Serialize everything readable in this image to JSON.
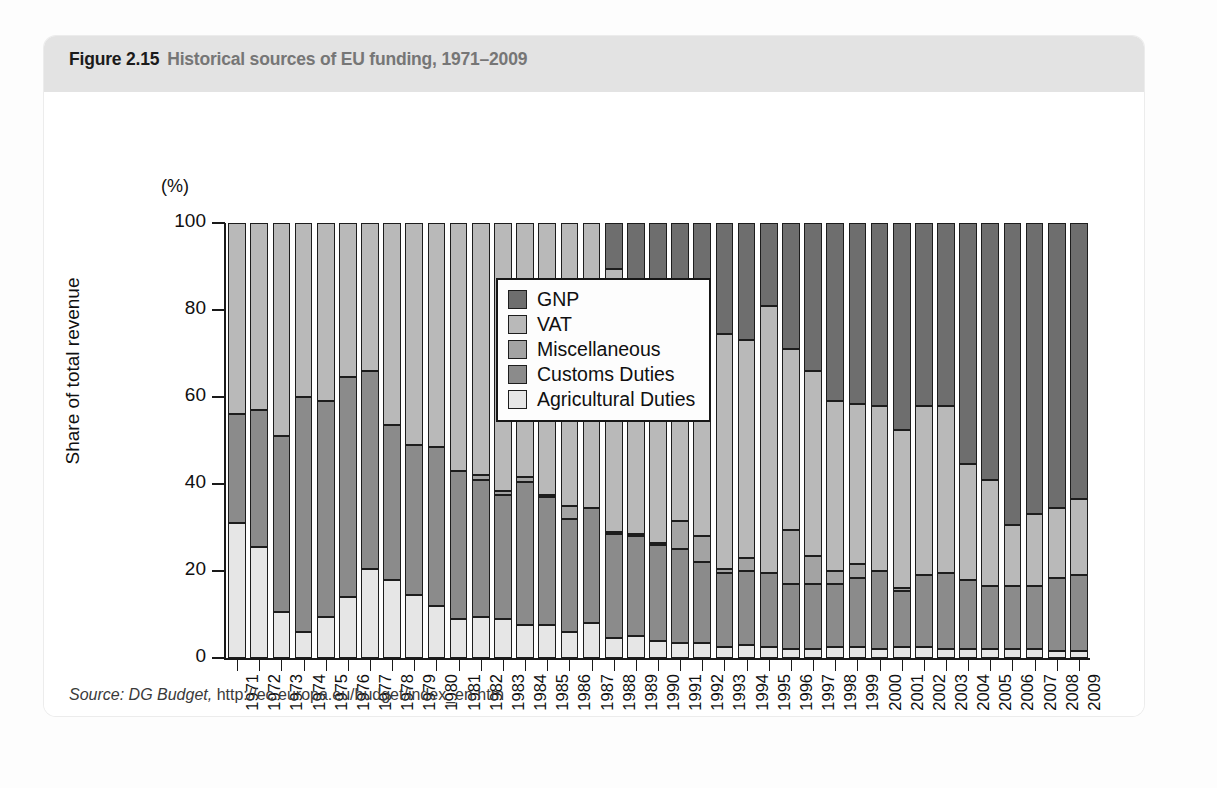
{
  "figure": {
    "label": "Figure 2.15",
    "caption": "Historical sources of EU funding, 1971–2009",
    "source_italic": "Source: DG Budget,",
    "source_rest": "http://ec.europa.eu/budget/index_en.htm"
  },
  "chart_data": {
    "type": "bar",
    "subtype": "stacked-percentage-column",
    "title": "Historical sources of EU funding, 1971–2009",
    "xlabel": "",
    "ylabel": "Share of total revenue",
    "yunit": "(%)",
    "ylim": [
      0,
      100
    ],
    "yticks": [
      0,
      20,
      40,
      60,
      80,
      100
    ],
    "grid": false,
    "legend_position": "center-left-inside",
    "stack_order_bottom_to_top": [
      "Agricultural Duties",
      "Customs Duties",
      "Miscellaneous",
      "VAT",
      "GNP"
    ],
    "colors": {
      "GNP": "#6e6e6e",
      "VAT": "#b9b9b9",
      "Miscellaneous": "#a3a3a3",
      "Customs Duties": "#8b8b8b",
      "Agricultural Duties": "#e6e6e6"
    },
    "categories": [
      "1971",
      "1972",
      "1973",
      "1974",
      "1975",
      "1976",
      "1977",
      "1978",
      "1979",
      "1980",
      "1981",
      "1982",
      "1983",
      "1984",
      "1985",
      "1986",
      "1987",
      "1988",
      "1989",
      "1990",
      "1991",
      "1992",
      "1993",
      "1994",
      "1995",
      "1996",
      "1997",
      "1998",
      "1999",
      "2000",
      "2001",
      "2002",
      "2003",
      "2004",
      "2005",
      "2006",
      "2007",
      "2008",
      "2009"
    ],
    "series": [
      {
        "name": "Agricultural Duties",
        "values": [
          31,
          25.5,
          10.5,
          6,
          9.5,
          14,
          20.5,
          18,
          14.5,
          12,
          9,
          9.5,
          9,
          7.5,
          7.5,
          6,
          8,
          4.5,
          5,
          4,
          3.5,
          3.5,
          2.5,
          3,
          2.5,
          2,
          2,
          2.5,
          2.5,
          2,
          2.5,
          2.5,
          2,
          2,
          2,
          2,
          2,
          1.5,
          1.5
        ]
      },
      {
        "name": "Customs Duties",
        "values": [
          25,
          31.5,
          40.5,
          54,
          49.5,
          50.5,
          45.5,
          35.5,
          34.5,
          36.5,
          34,
          31.5,
          28.5,
          33,
          29.5,
          26,
          26.5,
          24,
          23,
          22,
          21.5,
          18.5,
          17,
          17,
          17,
          15,
          15,
          14.5,
          16,
          18,
          13,
          16.5,
          17.5,
          16,
          14.5,
          14.5,
          14.5,
          17,
          17.5
        ]
      },
      {
        "name": "Miscellaneous",
        "values": [
          0,
          0,
          0,
          0,
          0,
          0,
          0,
          0,
          0,
          0,
          0,
          1,
          1,
          1,
          0.5,
          3,
          0,
          0.5,
          0.5,
          0.5,
          6.5,
          6,
          1,
          3,
          0,
          12.5,
          6.5,
          3,
          3,
          0,
          0.5,
          0,
          0,
          0,
          0,
          0,
          0,
          0,
          0
        ]
      },
      {
        "name": "VAT",
        "values": [
          44,
          43,
          49,
          40,
          41,
          35.5,
          34,
          46.5,
          51,
          51.5,
          57,
          58,
          61.5,
          58.5,
          62.5,
          65,
          65.5,
          60.5,
          57,
          59,
          55,
          58.5,
          54,
          50,
          61.5,
          41.5,
          42.5,
          39,
          37,
          38,
          36.5,
          39,
          38.5,
          26.5,
          24.5,
          14,
          16.5,
          16,
          17.5
        ]
      },
      {
        "name": "GNP",
        "values": [
          0,
          0,
          0,
          0,
          0,
          0,
          0,
          0,
          0,
          0,
          0,
          0,
          0,
          0,
          0,
          0,
          0,
          10.5,
          14.5,
          14.5,
          13.5,
          13.5,
          25.5,
          27,
          19,
          29,
          34,
          41,
          41.5,
          42,
          47.5,
          42,
          42,
          55.5,
          59,
          69.5,
          67,
          65.5,
          63.5
        ]
      }
    ]
  }
}
